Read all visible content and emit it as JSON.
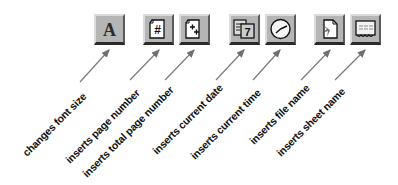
{
  "toolbar": {
    "buttons": [
      {
        "id": "font",
        "icon": "font-a-icon",
        "glyph": "A",
        "x": 94,
        "y": 14
      },
      {
        "id": "page-number",
        "icon": "page-number-icon",
        "glyph": "#",
        "x": 143,
        "y": 14
      },
      {
        "id": "total-pages",
        "icon": "total-pages-icon",
        "glyph": "++",
        "x": 179,
        "y": 14
      },
      {
        "id": "date",
        "icon": "calendar-date-icon",
        "glyph": "7",
        "x": 229,
        "y": 14
      },
      {
        "id": "time",
        "icon": "clock-icon",
        "glyph": "",
        "x": 265,
        "y": 14
      },
      {
        "id": "file-name",
        "icon": "file-name-icon",
        "glyph": "",
        "x": 314,
        "y": 14
      },
      {
        "id": "sheet-name",
        "icon": "sheet-name-icon",
        "glyph": "",
        "x": 350,
        "y": 14
      }
    ]
  },
  "labels": [
    {
      "text": "changes font size",
      "x": 20,
      "y": 150
    },
    {
      "text": "inserts page number",
      "x": 63,
      "y": 157
    },
    {
      "text": "inserts total page number",
      "x": 80,
      "y": 171
    },
    {
      "text": "inserts current date",
      "x": 150,
      "y": 148
    },
    {
      "text": "inserts current time",
      "x": 188,
      "y": 153
    },
    {
      "text": "inserts file name",
      "x": 247,
      "y": 138
    },
    {
      "text": "inserts sheet name",
      "x": 274,
      "y": 150
    }
  ],
  "arrows": [
    {
      "x1": 80,
      "y1": 82,
      "x2": 109,
      "y2": 50
    },
    {
      "x1": 130,
      "y1": 80,
      "x2": 159,
      "y2": 50
    },
    {
      "x1": 165,
      "y1": 80,
      "x2": 194,
      "y2": 50
    },
    {
      "x1": 216,
      "y1": 80,
      "x2": 244,
      "y2": 50
    },
    {
      "x1": 253,
      "y1": 80,
      "x2": 280,
      "y2": 50
    },
    {
      "x1": 301,
      "y1": 80,
      "x2": 330,
      "y2": 50
    },
    {
      "x1": 335,
      "y1": 80,
      "x2": 365,
      "y2": 50
    }
  ],
  "colors": {
    "button_face": "#b5b5b5",
    "arrow": "#7a7a7a",
    "text": "#111111"
  }
}
